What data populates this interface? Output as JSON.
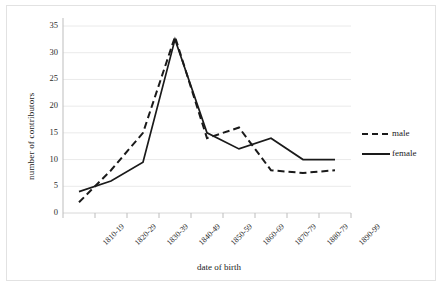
{
  "chart_data": {
    "type": "line",
    "title": "",
    "xlabel": "date of birth",
    "ylabel": "number of contributors",
    "categories": [
      "1810-19",
      "1820-29",
      "1830-39",
      "1840-49",
      "1850-59",
      "1860-69",
      "1870-79",
      "1880-79",
      "1890-99"
    ],
    "yticks": [
      "0",
      "5",
      "10",
      "15",
      "20",
      "25",
      "30",
      "35"
    ],
    "ylim": [
      0,
      35
    ],
    "grid": true,
    "legend_position": "right",
    "series": [
      {
        "name": "male",
        "style": "dashed",
        "color": "#1a1a1a",
        "values": [
          2,
          8,
          15,
          33,
          14,
          16,
          8,
          7.5,
          8
        ]
      },
      {
        "name": "female",
        "style": "solid",
        "color": "#1a1a1a",
        "values": [
          4,
          6,
          9.5,
          32.5,
          15,
          12,
          14,
          10,
          10
        ]
      }
    ]
  },
  "legend": {
    "items": [
      {
        "label": "male"
      },
      {
        "label": "female"
      }
    ]
  },
  "axes": {
    "y_title": "number of contributors",
    "x_title": "date of birth"
  }
}
